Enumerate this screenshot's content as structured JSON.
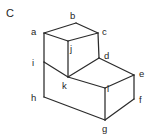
{
  "figure": {
    "title": "C",
    "title_position": {
      "x": 6,
      "y": 8
    },
    "background_color": "#ffffff",
    "line_color": "#2b2b2b",
    "text_color": "#1e1e1e",
    "width": 153,
    "height": 140,
    "vertices": [
      {
        "id": "a",
        "label": "a",
        "label_x": 31,
        "label_y": 27,
        "point_x": 44,
        "point_y": 33
      },
      {
        "id": "b",
        "label": "b",
        "label_x": 70,
        "label_y": 11,
        "point_x": 76,
        "point_y": 23
      },
      {
        "id": "c",
        "label": "c",
        "label_x": 102,
        "label_y": 27,
        "point_x": 98,
        "point_y": 33
      },
      {
        "id": "d",
        "label": "d",
        "label_x": 104,
        "label_y": 51,
        "point_x": 99,
        "point_y": 58
      },
      {
        "id": "e",
        "label": "e",
        "label_x": 139,
        "label_y": 69,
        "point_x": 134,
        "point_y": 75
      },
      {
        "id": "f",
        "label": "f",
        "label_x": 139,
        "label_y": 95,
        "point_x": 134,
        "point_y": 99
      },
      {
        "id": "g",
        "label": "g",
        "label_x": 102,
        "label_y": 124,
        "point_x": 105,
        "point_y": 120
      },
      {
        "id": "h",
        "label": "h",
        "label_x": 31,
        "label_y": 93,
        "point_x": 44,
        "point_y": 97
      },
      {
        "id": "i",
        "label": "i",
        "label_x": 32,
        "label_y": 58,
        "point_x": 44,
        "point_y": 62
      },
      {
        "id": "j",
        "label": "j",
        "label_x": 70,
        "label_y": 44,
        "point_x": 68,
        "point_y": 41
      },
      {
        "id": "k",
        "label": "k",
        "label_x": 62,
        "label_y": 81,
        "point_x": 68,
        "point_y": 77
      },
      {
        "id": "l",
        "label": "l",
        "label_x": 107,
        "label_y": 84,
        "point_x": 105,
        "point_y": 88
      }
    ],
    "edges": [
      {
        "from": "a",
        "to": "b",
        "path": "M44,33 L76,23"
      },
      {
        "from": "b",
        "to": "c",
        "path": "M76,23 L98,33"
      },
      {
        "from": "a",
        "to": "j",
        "path": "M44,33 L68,41"
      },
      {
        "from": "j",
        "to": "c",
        "path": "M68,41 L98,33"
      },
      {
        "from": "a",
        "to": "i",
        "path": "M44,33 L44,62"
      },
      {
        "from": "j",
        "to": "k",
        "path": "M68,41 L68,77"
      },
      {
        "from": "c",
        "to": "d",
        "path": "M98,33 L99,58"
      },
      {
        "from": "i",
        "to": "k",
        "path": "M44,62 L68,77"
      },
      {
        "from": "k",
        "to": "d",
        "path": "M68,77 L99,58"
      },
      {
        "from": "d",
        "to": "e",
        "path": "M99,58 L134,75"
      },
      {
        "from": "k",
        "to": "l",
        "path": "M68,77 L105,88"
      },
      {
        "from": "l",
        "to": "e",
        "path": "M105,88 L134,75"
      },
      {
        "from": "i",
        "to": "h",
        "path": "M44,62 L44,97"
      },
      {
        "from": "l",
        "to": "g",
        "path": "M105,88 L105,120"
      },
      {
        "from": "e",
        "to": "f",
        "path": "M134,75 L134,99"
      },
      {
        "from": "h",
        "to": "g",
        "path": "M44,97 L105,120"
      },
      {
        "from": "g",
        "to": "f",
        "path": "M105,120 L134,99"
      }
    ]
  }
}
